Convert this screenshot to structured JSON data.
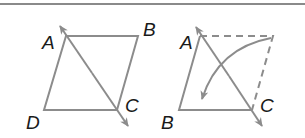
{
  "figure": {
    "stroke_color": "#8c8c8c",
    "label_color": "#1a1a1a",
    "left_diagram": {
      "labels": {
        "A": "A",
        "B": "B",
        "C": "C",
        "D": "D"
      }
    },
    "right_diagram": {
      "labels": {
        "A": "A",
        "B": "B",
        "C": "C"
      }
    }
  }
}
